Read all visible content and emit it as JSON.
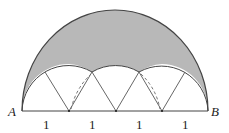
{
  "figure": {
    "points": {
      "left": "A",
      "right": "B"
    },
    "segment_labels": [
      "1",
      "1",
      "1",
      "1"
    ],
    "colors": {
      "shade": "#b8b8b8",
      "stroke": "#444444",
      "background": "#ffffff"
    }
  }
}
